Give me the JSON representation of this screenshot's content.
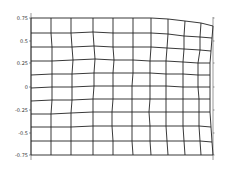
{
  "chart_data": {
    "type": "line",
    "title": "",
    "subtitle": "",
    "xlabel": "",
    "ylabel": "",
    "grid": false,
    "legend": null,
    "ylim": [
      -0.75,
      0.75
    ],
    "y_ticks": [
      {
        "label": "0.75",
        "value": 0.75,
        "py": 18
      },
      {
        "label": "0.5",
        "value": 0.5,
        "py": 41
      },
      {
        "label": "0.25",
        "value": 0.25,
        "py": 63
      },
      {
        "label": "0",
        "value": 0,
        "py": 87
      },
      {
        "label": "-0.25",
        "value": -0.25,
        "py": 110
      },
      {
        "label": "-0.5",
        "value": -0.5,
        "py": 133
      },
      {
        "label": "-0.75",
        "value": -0.75,
        "py": 155
      }
    ],
    "axis": {
      "left_x": 31,
      "right_x": 213,
      "top_y": 13,
      "bottom_y": 160
    },
    "mesh_columns_x": [
      31,
      51,
      71,
      93,
      113,
      133,
      151,
      168,
      185,
      201,
      213
    ],
    "mesh_rows": [
      [
        18,
        18,
        18,
        18,
        18,
        18,
        18,
        19,
        21,
        23,
        26
      ],
      [
        33,
        33,
        33,
        32,
        33,
        33,
        33,
        34,
        36,
        37,
        38
      ],
      [
        47,
        47,
        47,
        46,
        47,
        47,
        47,
        48,
        49,
        50,
        51
      ],
      [
        61,
        61,
        60,
        59,
        60,
        60,
        61,
        61,
        62,
        63,
        63
      ],
      [
        75,
        74,
        74,
        73,
        73,
        73,
        73,
        74,
        74,
        75,
        75
      ],
      [
        88,
        87,
        87,
        86,
        86,
        86,
        86,
        86,
        87,
        87,
        87
      ],
      [
        101,
        100,
        100,
        99,
        99,
        99,
        99,
        99,
        99,
        99,
        99
      ],
      [
        114,
        114,
        113,
        112,
        112,
        112,
        112,
        112,
        112,
        112,
        112
      ],
      [
        127,
        127,
        127,
        126,
        126,
        126,
        126,
        126,
        126,
        126,
        127
      ],
      [
        141,
        141,
        141,
        141,
        141,
        141,
        141,
        141,
        141,
        141,
        142
      ],
      [
        155,
        155,
        155,
        155,
        155,
        155,
        155,
        155,
        155,
        155,
        155
      ]
    ],
    "mesh_column_shift": [
      [
        0,
        0,
        0,
        0,
        0,
        0,
        0,
        0,
        0,
        0,
        0
      ],
      [
        0,
        0,
        0,
        0,
        0,
        0,
        0,
        0,
        -1,
        -1,
        -1
      ],
      [
        0,
        1,
        1,
        1,
        0,
        0,
        0,
        -1,
        -1,
        -1,
        -2
      ],
      [
        0,
        1,
        2,
        2,
        1,
        0,
        -1,
        -2,
        -2,
        -3,
        -3
      ],
      [
        0,
        1,
        1,
        1,
        0,
        0,
        -1,
        -2,
        -2,
        -3,
        -3
      ],
      [
        0,
        1,
        1,
        1,
        0,
        -1,
        -1,
        -2,
        -2,
        -3,
        -3
      ],
      [
        0,
        1,
        1,
        0,
        0,
        -1,
        -1,
        -2,
        -2,
        -2,
        -3
      ],
      [
        0,
        0,
        0,
        0,
        -1,
        -1,
        -2,
        -2,
        -2,
        -2,
        -3
      ],
      [
        0,
        0,
        0,
        0,
        -1,
        -1,
        -1,
        -2,
        -2,
        -2,
        -2
      ],
      [
        0,
        0,
        0,
        0,
        0,
        -1,
        -1,
        -1,
        -1,
        -1,
        -1
      ],
      [
        0,
        0,
        0,
        0,
        0,
        0,
        0,
        0,
        0,
        0,
        0
      ]
    ]
  },
  "colors": {
    "background": "#ffffff",
    "mesh": "#222222",
    "axis": "#555555",
    "text": "#333333"
  }
}
